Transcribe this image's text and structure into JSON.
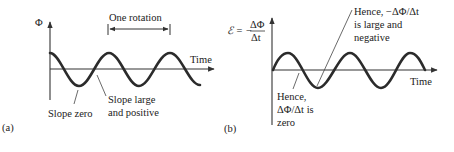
{
  "panel_a": {
    "tag": "(a)",
    "y_axis_label": "Φ",
    "x_axis_label": "Time",
    "bracket_label": "One rotation",
    "annotations": [
      {
        "line1": "Slope zero"
      },
      {
        "line1": "Slope large",
        "line2": "and positive"
      }
    ],
    "curve": "cosine"
  },
  "panel_b": {
    "tag": "(b)",
    "y_axis_label_symbol": "ℰ = −",
    "y_axis_label_num": "ΔΦ",
    "y_axis_label_den": "Δt",
    "x_axis_label": "Time",
    "annotations": [
      {
        "line1": "Hence, −ΔΦ/Δt",
        "line2": "is large and",
        "line3": "negative"
      },
      {
        "line1": "Hence,",
        "line2": "ΔΦ/Δt is",
        "line3": "zero"
      }
    ],
    "curve": "sine"
  },
  "colors": {
    "curve": "#2b2b2b",
    "axis": "#333333",
    "text": "#222222"
  }
}
